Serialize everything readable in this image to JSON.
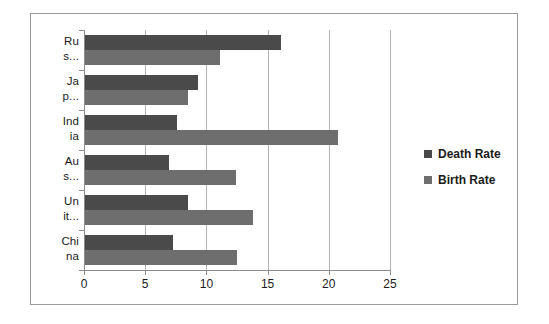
{
  "chart_data": {
    "type": "bar",
    "orientation": "horizontal",
    "title": "",
    "xlabel": "",
    "ylabel": "",
    "xlim": [
      0,
      25
    ],
    "xticks": [
      0,
      5,
      10,
      15,
      20,
      25
    ],
    "xtick_labels": [
      "0",
      "5",
      "10",
      "15",
      "20",
      "25"
    ],
    "grid": true,
    "legend_position": "right",
    "categories": [
      "Russia",
      "Japan",
      "India",
      "Australia",
      "United States",
      "China"
    ],
    "category_display_labels": [
      [
        "Ru",
        "s..."
      ],
      [
        "Ja",
        "p..."
      ],
      [
        "Ind",
        "ia"
      ],
      [
        "Au",
        "s..."
      ],
      [
        "Un",
        "it..."
      ],
      [
        "Chi",
        "na"
      ]
    ],
    "series": [
      {
        "name": "Death Rate",
        "color": "#4a4a4a",
        "values": [
          16.0,
          9.2,
          7.5,
          6.9,
          8.4,
          7.2
        ]
      },
      {
        "name": "Birth Rate",
        "color": "#6e6e6e",
        "values": [
          11.0,
          8.4,
          20.7,
          12.3,
          13.7,
          12.4
        ]
      }
    ]
  },
  "legend": {
    "items": [
      {
        "label": "Death Rate",
        "color": "#4a4a4a"
      },
      {
        "label": "Birth Rate",
        "color": "#6e6e6e"
      }
    ]
  },
  "axis": {
    "tick_labels": [
      "0",
      "5",
      "10",
      "15",
      "20",
      "25"
    ]
  }
}
